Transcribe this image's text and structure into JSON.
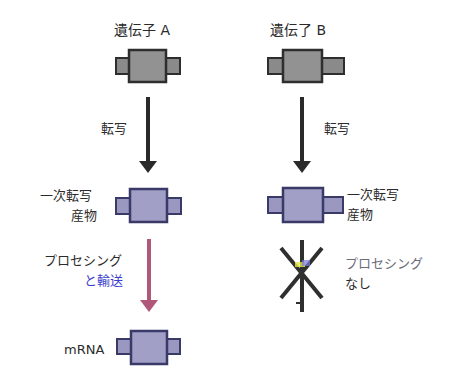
{
  "diagram": {
    "gene_a": {
      "title": "遺伝子 A",
      "step1_label": "転写",
      "primary_label_line1": "一次転写",
      "primary_label_line2": "産物",
      "step2_label_line1": "プロセシング",
      "step2_label_line2": "と輸送",
      "final_label": "mRNA"
    },
    "gene_b": {
      "title": "遺伝了 B",
      "step1_label": "転写",
      "primary_label_line1": "一次転写",
      "primary_label_line2": "産物",
      "step2_label_line1": "プロセシング",
      "step2_label_line2": "なし"
    },
    "colors": {
      "gene_box_fill": "#8e8e8e",
      "gene_box_border": "#2e2e2e",
      "rna_box_fill": "#9a98c0",
      "rna_box_border": "#3a3a68",
      "arrow_black": "#2a2a2a",
      "arrow_processing": "#b0587a"
    }
  }
}
